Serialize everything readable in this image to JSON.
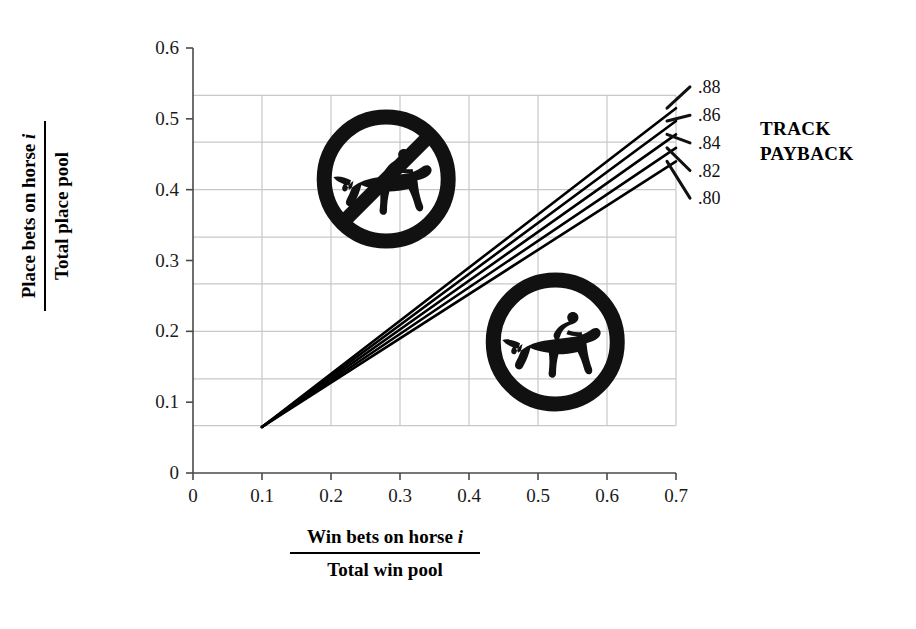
{
  "chart_data": {
    "type": "line",
    "title": "",
    "xlabel_numerator": "Win bets on horse",
    "xlabel_numerator_italic": "i",
    "xlabel_denominator": "Total win pool",
    "ylabel_numerator": "Place bets on horse",
    "ylabel_numerator_italic": "i",
    "ylabel_denominator": "Total place pool",
    "xlim": [
      0,
      0.7
    ],
    "ylim": [
      0,
      0.6
    ],
    "xticks": [
      "0",
      "0.1",
      "0.2",
      "0.3",
      "0.4",
      "0.5",
      "0.6",
      "0.7"
    ],
    "xtick_values": [
      0,
      0.1,
      0.2,
      0.3,
      0.4,
      0.5,
      0.6,
      0.7
    ],
    "yticks": [
      "0",
      "0.1",
      "0.2",
      "0.3",
      "0.4",
      "0.5",
      "0.6"
    ],
    "ytick_values": [
      0,
      0.1,
      0.2,
      0.3,
      0.4,
      0.5,
      0.6
    ],
    "grid": true,
    "grid_x_values": [
      0.1,
      0.2,
      0.3,
      0.4,
      0.5,
      0.6,
      0.7
    ],
    "grid_y_values": [
      0.067,
      0.133,
      0.2,
      0.267,
      0.333,
      0.4,
      0.467,
      0.533
    ],
    "legend_title_line1": "TRACK",
    "legend_title_line2": "PAYBACK",
    "legend_position": "right",
    "line_color": "#000000",
    "x": [
      0.1,
      0.7
    ],
    "series": [
      {
        "name": ".88",
        "values": [
          0.065,
          0.515
        ]
      },
      {
        "name": ".86",
        "values": [
          0.065,
          0.497
        ]
      },
      {
        "name": ".84",
        "values": [
          0.065,
          0.478
        ]
      },
      {
        "name": ".82",
        "values": [
          0.065,
          0.459
        ]
      },
      {
        "name": ".80",
        "values": [
          0.065,
          0.44
        ]
      }
    ],
    "end_labels": [
      {
        "text": ".88",
        "y": 0.545
      },
      {
        "text": ".86",
        "y": 0.505
      },
      {
        "text": ".84",
        "y": 0.466
      },
      {
        "text": ".82",
        "y": 0.427
      },
      {
        "text": ".80",
        "y": 0.388
      }
    ],
    "annotations": [
      {
        "name": "no-horse-racing-medallion",
        "x": 0.28,
        "y": 0.415
      },
      {
        "name": "horse-racing-medallion",
        "x": 0.525,
        "y": 0.185
      }
    ]
  }
}
